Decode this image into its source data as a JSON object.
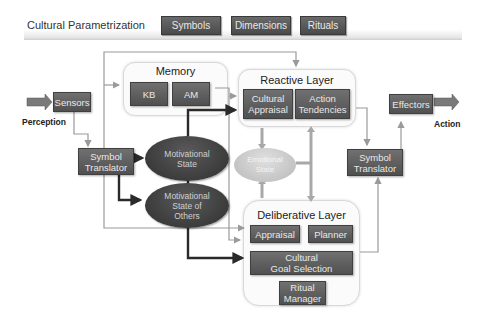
{
  "header": {
    "title": "Cultural Parametrization",
    "buttons": [
      {
        "label": "Symbols"
      },
      {
        "label": "Dimensions"
      },
      {
        "label": "Rituals"
      }
    ]
  },
  "nodes": {
    "sensors": "Sensors",
    "perception": "Perception",
    "effectors": "Effectors",
    "action": "Action",
    "symbol_translator_in": [
      "Symbol",
      "Translator"
    ],
    "symbol_translator_out": [
      "Symbol",
      "Translator"
    ],
    "memory": {
      "title": "Memory",
      "kb": "KB",
      "am": "AM"
    },
    "reactive_layer": {
      "title": "Reactive Layer",
      "cultural_appraisal": [
        "Cultural",
        "Appraisal"
      ],
      "action_tendencies": [
        "Action",
        "Tendencies"
      ]
    },
    "motivational_state": [
      "Motivational",
      "State"
    ],
    "motivational_state_others": [
      "Motivational",
      "State of",
      "Others"
    ],
    "emotional_state": [
      "Emotional",
      "State"
    ],
    "deliberative_layer": {
      "title": "Deliberative Layer",
      "appraisal": "Appraisal",
      "planner": "Planner",
      "cultural_goal_selection": [
        "Cultural",
        "Goal Selection"
      ],
      "ritual_manager": [
        "Ritual",
        "Manager"
      ]
    }
  },
  "colors": {
    "box_fill": "#5f5f5f",
    "ellipse_dark": "#3a3a3a",
    "ellipse_light": "#c8c8c8",
    "arrow_light": "#9a9a9a",
    "arrow_dark": "#2a2a2a",
    "panel_bg": "#fbfbfb"
  }
}
